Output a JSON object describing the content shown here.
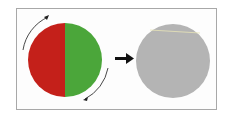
{
  "diagram": {
    "left_disk": {
      "left_half_color": "#c4201a",
      "right_half_color": "#4ba63a",
      "rotation_arrows": 2
    },
    "transition_arrow": "right-arrow",
    "right_disk": {
      "color": "#b4b4b4",
      "highlight_line_color": "#e8e4b8"
    },
    "frame_color": "#a8a8a8"
  }
}
